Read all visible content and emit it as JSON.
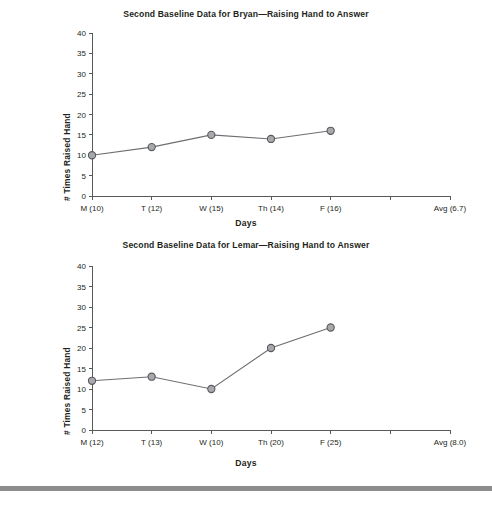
{
  "page": {
    "footer_rule_color": "#8a8c8e",
    "background": "#ffffff"
  },
  "charts": [
    {
      "id": "bryan",
      "title": "Second Baseline Data for Bryan—Raising Hand to Answer",
      "ylabel": "# Times Raised Hand",
      "xlabel": "Days"
    },
    {
      "id": "lemar",
      "title": "Second Baseline Data for Lemar—Raising Hand to Answer",
      "ylabel": "# Times Raised Hand",
      "xlabel": "Days"
    }
  ],
  "chart_data": [
    {
      "type": "line",
      "title": "Second Baseline Data for Bryan—Raising Hand to Answer",
      "xlabel": "Days",
      "ylabel": "# Times Raised Hand",
      "categories": [
        "M (10)",
        "T (12)",
        "W (15)",
        "Th (14)",
        "F (16)",
        "",
        "Avg (6.7)"
      ],
      "x_tick_labels": [
        "M (10)",
        "T (12)",
        "W (15)",
        "Th (14)",
        "F (16)",
        "",
        "Avg (6.7)"
      ],
      "values": [
        10,
        12,
        15,
        14,
        16,
        null,
        null
      ],
      "average": 6.7,
      "ylim": [
        0,
        40
      ],
      "ytick_labels": [
        "0",
        "5",
        "10",
        "15",
        "20",
        "25",
        "30",
        "35",
        "40"
      ],
      "yticks": [
        0,
        5,
        10,
        15,
        20,
        25,
        30,
        35,
        40
      ],
      "grid": false,
      "legend": "none",
      "marker_fill": "#a7a9ac",
      "marker_stroke": "#58595b",
      "line_color": "#6d6e71"
    },
    {
      "type": "line",
      "title": "Second Baseline Data for Lemar—Raising Hand to Answer",
      "xlabel": "Days",
      "ylabel": "# Times Raised Hand",
      "categories": [
        "M (12)",
        "T (13)",
        "W (10)",
        "Th (20)",
        "F (25)",
        "",
        "Avg (8.0)"
      ],
      "x_tick_labels": [
        "M (12)",
        "T (13)",
        "W (10)",
        "Th (20)",
        "F (25)",
        "",
        "Avg (8.0)"
      ],
      "values": [
        12,
        13,
        10,
        20,
        25,
        null,
        null
      ],
      "average": 8.0,
      "ylim": [
        0,
        40
      ],
      "ytick_labels": [
        "0",
        "5",
        "10",
        "15",
        "20",
        "25",
        "30",
        "35",
        "40"
      ],
      "yticks": [
        0,
        5,
        10,
        15,
        20,
        25,
        30,
        35,
        40
      ],
      "grid": false,
      "legend": "none",
      "marker_fill": "#a7a9ac",
      "marker_stroke": "#58595b",
      "line_color": "#6d6e71"
    }
  ]
}
